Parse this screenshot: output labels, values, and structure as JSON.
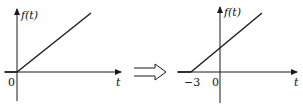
{
  "left_graph": {
    "y_label": "f(t)",
    "x_label": "t",
    "origin_label": "0",
    "description": "ramp starting at t=0"
  },
  "right_graph": {
    "y_label": "f(t)",
    "x_label": "t",
    "origin_label": "0",
    "shift_label": "−3",
    "description": "ramp shifted left, starting at t=-3"
  },
  "transform_arrow": "implies-arrow",
  "colors": {
    "stroke": "#1a1a1a",
    "background": "#ffffff"
  }
}
